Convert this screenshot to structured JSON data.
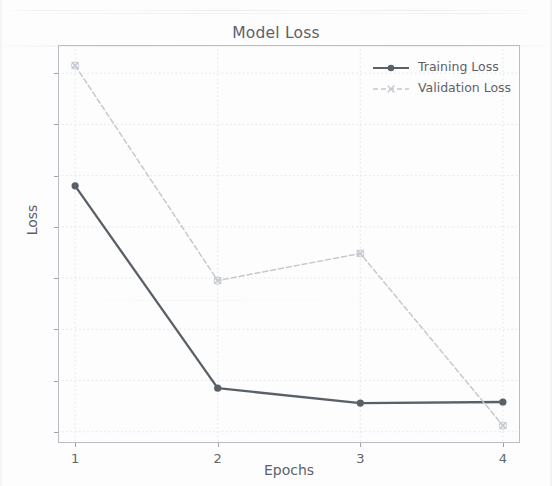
{
  "chart_data": {
    "type": "line",
    "title": "Model Loss",
    "xlabel": "Epochs",
    "ylabel": "Loss",
    "x": [
      1,
      2,
      3,
      4
    ],
    "xticks": [
      "1",
      "2",
      "3",
      "4"
    ],
    "yticks": [
      "0.0",
      "0.1",
      "0.2",
      "0.3",
      "0.4",
      "0.5",
      "0.6",
      "0.7"
    ],
    "ytick_values": [
      0.0,
      0.1,
      0.2,
      0.3,
      0.4,
      0.5,
      0.6,
      0.7
    ],
    "xlim": [
      0.88,
      4.12
    ],
    "ylim": [
      -0.022,
      0.755
    ],
    "grid": true,
    "legend_position": "upper right",
    "legend_frame": false,
    "series": [
      {
        "name": "Training Loss",
        "values": [
          0.48,
          0.085,
          0.056,
          0.058
        ],
        "color": "#5a6068",
        "marker": "circle",
        "linestyle": "solid"
      },
      {
        "name": "Validation Loss",
        "values": [
          0.715,
          0.295,
          0.348,
          0.012
        ],
        "color": "#c4c9d0",
        "marker": "x",
        "linestyle": "dashed"
      }
    ]
  },
  "legend": {
    "items": [
      {
        "label": "Training Loss"
      },
      {
        "label": "Validation Loss"
      }
    ]
  }
}
